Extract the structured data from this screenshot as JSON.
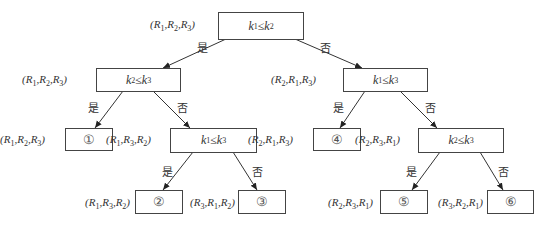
{
  "diagram": {
    "type": "decision-tree",
    "branch_labels": {
      "yes": "是",
      "no": "否"
    },
    "nodes": [
      {
        "id": "n0",
        "kind": "decision",
        "cond": {
          "a": "k",
          "ai": "1",
          "op": "≤",
          "b": "k",
          "bi": "2"
        },
        "tuple": [
          "1",
          "2",
          "3"
        ]
      },
      {
        "id": "n1",
        "kind": "decision",
        "cond": {
          "a": "k",
          "ai": "2",
          "op": "≤",
          "b": "k",
          "bi": "3"
        },
        "tuple": [
          "1",
          "2",
          "3"
        ]
      },
      {
        "id": "n2",
        "kind": "decision",
        "cond": {
          "a": "k",
          "ai": "1",
          "op": "≤",
          "b": "k",
          "bi": "3"
        },
        "tuple": [
          "2",
          "1",
          "3"
        ]
      },
      {
        "id": "n3",
        "kind": "leaf",
        "label": "①",
        "tuple": [
          "1",
          "2",
          "3"
        ]
      },
      {
        "id": "n4",
        "kind": "decision",
        "cond": {
          "a": "k",
          "ai": "1",
          "op": "≤",
          "b": "k",
          "bi": "3"
        },
        "tuple": [
          "1",
          "3",
          "2"
        ]
      },
      {
        "id": "n5",
        "kind": "leaf",
        "label": "④",
        "tuple": [
          "2",
          "1",
          "3"
        ]
      },
      {
        "id": "n6",
        "kind": "decision",
        "cond": {
          "a": "k",
          "ai": "2",
          "op": "≤",
          "b": "k",
          "bi": "3"
        },
        "tuple": [
          "2",
          "3",
          "1"
        ]
      },
      {
        "id": "n7",
        "kind": "leaf",
        "label": "②",
        "tuple": [
          "1",
          "3",
          "2"
        ]
      },
      {
        "id": "n8",
        "kind": "leaf",
        "label": "③",
        "tuple": [
          "3",
          "1",
          "2"
        ]
      },
      {
        "id": "n9",
        "kind": "leaf",
        "label": "⑤",
        "tuple": [
          "2",
          "3",
          "1"
        ]
      },
      {
        "id": "n10",
        "kind": "leaf",
        "label": "⑥",
        "tuple": [
          "3",
          "2",
          "1"
        ]
      }
    ],
    "edges": [
      {
        "from": "n0",
        "to": "n1",
        "label": "是"
      },
      {
        "from": "n0",
        "to": "n2",
        "label": "否"
      },
      {
        "from": "n1",
        "to": "n3",
        "label": "是"
      },
      {
        "from": "n1",
        "to": "n4",
        "label": "否"
      },
      {
        "from": "n2",
        "to": "n5",
        "label": "是"
      },
      {
        "from": "n2",
        "to": "n6",
        "label": "否"
      },
      {
        "from": "n4",
        "to": "n7",
        "label": "是"
      },
      {
        "from": "n4",
        "to": "n8",
        "label": "否"
      },
      {
        "from": "n6",
        "to": "n9",
        "label": "是"
      },
      {
        "from": "n6",
        "to": "n10",
        "label": "否"
      }
    ]
  }
}
